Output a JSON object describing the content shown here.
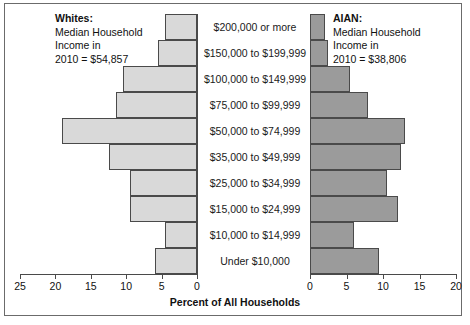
{
  "chart_data": {
    "type": "bar",
    "subtype": "population-pyramid",
    "title": "",
    "xlabel": "Percent of All Households",
    "ylabel": "",
    "grid": false,
    "legend_position": "inside-top",
    "categories": [
      "$200,000 or more",
      "$150,000 to $199,999",
      "$100,000 to $149,999",
      "$75,000 to $99,999",
      "$50,000 to $74,999",
      "$35,000 to $49,999",
      "$25,000 to $34,999",
      "$15,000 to $24,999",
      "$10,000 to $14,999",
      "Under $10,000"
    ],
    "series": [
      {
        "name": "Whites",
        "side": "left",
        "color": "#d9d9d9",
        "axis_ticks": [
          25,
          20,
          15,
          10,
          5,
          0
        ],
        "axis_max": 25,
        "values": [
          4.5,
          5.5,
          10.5,
          11.5,
          19.0,
          12.5,
          9.5,
          9.5,
          4.5,
          6.0
        ]
      },
      {
        "name": "AIAN",
        "side": "right",
        "color": "#9b9b9b",
        "axis_ticks": [
          0,
          5,
          10,
          15,
          20
        ],
        "axis_max": 20,
        "values": [
          2.0,
          2.5,
          5.5,
          8.0,
          13.0,
          12.5,
          10.5,
          12.0,
          6.0,
          9.5
        ]
      }
    ]
  },
  "left_header": {
    "line1": "Whites:",
    "line2": "Median Household",
    "line3": "Income in",
    "line4": "2010 = $54,857"
  },
  "right_header": {
    "line1": "AIAN:",
    "line2": "Median Household",
    "line3": "Income in",
    "line4": "2010 = $38,806"
  },
  "axis": {
    "title": "Percent of All Households",
    "left_ticks": [
      "25",
      "20",
      "15",
      "10",
      "5",
      "0"
    ],
    "right_ticks": [
      "0",
      "5",
      "10",
      "15",
      "20"
    ]
  },
  "colors": {
    "left_bar": "#d9d9d9",
    "right_bar": "#9b9b9b",
    "outline": "#4a4a4a",
    "frame": "#6b6b6b"
  }
}
